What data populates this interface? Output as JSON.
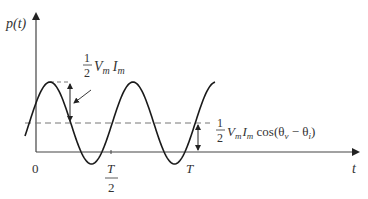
{
  "diagram": {
    "type": "waveform-plot",
    "colors": {
      "curve": "#1a1a1a",
      "axis": "#444444",
      "dashed": "#777777",
      "text": "#333333",
      "background": "#ffffff"
    },
    "y_axis": {
      "label": "p(t)"
    },
    "x_axis": {
      "label": "t",
      "ticks": [
        {
          "label": "0"
        },
        {
          "label_num": "T",
          "label_den": "2"
        },
        {
          "label": "T"
        }
      ]
    },
    "annotations": {
      "amplitude": {
        "frac_num": "1",
        "frac_den": "2",
        "expr": "V",
        "sub1": "m",
        "expr2": "I",
        "sub2": "m"
      },
      "average": {
        "frac_num": "1",
        "frac_den": "2",
        "expr": "V",
        "sub1": "m",
        "expr2": "I",
        "sub2": "m",
        "tail": " cos(θ",
        "sub3": "v",
        "mid": " − θ",
        "sub4": "i",
        "end": ")"
      }
    },
    "curve": {
      "description": "instantaneous power p(t) = ½VmIm cos(θv−θi) + ½VmIm cos(2ωt+θv+θi)",
      "mean_y_px": 123,
      "amplitude_px": 41,
      "period_px": 83,
      "x_start_px": 25,
      "x_end_px": 215
    }
  }
}
